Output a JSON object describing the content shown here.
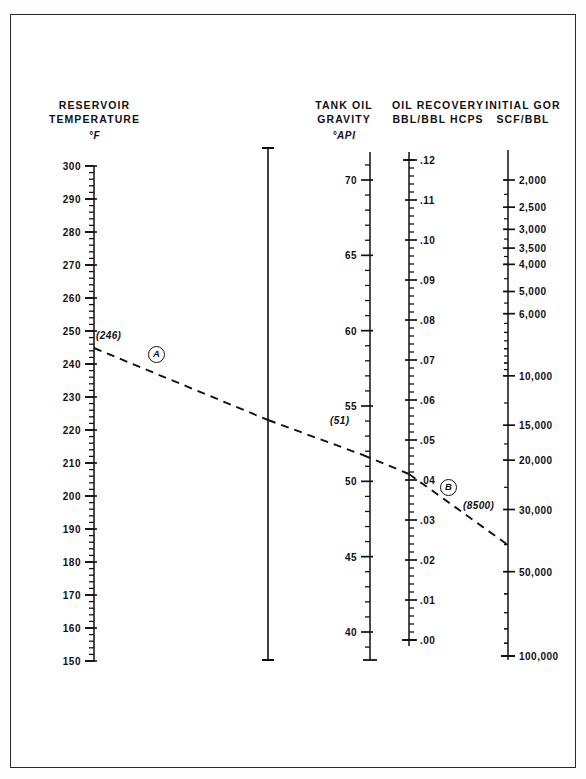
{
  "figure": {
    "kind": "nomograph",
    "background": "#ffffff",
    "border_color": "#2a2a2a",
    "line_color": "#111111"
  },
  "axes": {
    "temperature": {
      "title_line1": "RESERVOIR",
      "title_line2": "TEMPERATURE",
      "unit": "°F",
      "ticks": [
        "300",
        "290",
        "280",
        "270",
        "260",
        "250",
        "240",
        "230",
        "220",
        "210",
        "200",
        "190",
        "180",
        "170",
        "160",
        "150"
      ]
    },
    "gravity": {
      "title_line1": "TANK OIL",
      "title_line2": "GRAVITY",
      "unit": "°API",
      "ticks": [
        "70",
        "65",
        "60",
        "55",
        "50",
        "45",
        "40"
      ]
    },
    "recovery": {
      "title_line1": "OIL RECOVERY",
      "title_line2": "BBL/BBL HCPS",
      "unit": "",
      "ticks": [
        ".12",
        ".11",
        ".10",
        ".09",
        ".08",
        ".07",
        ".06",
        ".05",
        ".04",
        ".03",
        ".02",
        ".01",
        ".00"
      ]
    },
    "gor": {
      "title_line1": "INITIAL GOR",
      "title_line2": "SCF/BBL",
      "unit": "",
      "ticks": [
        "2,000",
        "2,500",
        "3,000",
        "3,500",
        "4,000",
        "5,000",
        "6,000",
        "10,000",
        "15,000",
        "20,000",
        "30,000",
        "50,000",
        "100,000"
      ]
    }
  },
  "annotations": {
    "temp_value": "(246)",
    "gravity_value": "(51)",
    "gor_value": "(8500)",
    "key_a": "A",
    "key_b": "B"
  },
  "chart_data": {
    "type": "line",
    "subtitle": "",
    "xlabel": "",
    "ylabel": "",
    "grid": false,
    "legend": "none",
    "scales": [
      {
        "name": "Reservoir Temperature",
        "units": "°F",
        "orientation": "vertical",
        "direction": "descending",
        "range": [
          150,
          300
        ],
        "major_step": 10,
        "minor_per_major": 5,
        "tick_labels": [
          "300",
          "290",
          "280",
          "270",
          "260",
          "250",
          "240",
          "230",
          "220",
          "210",
          "200",
          "190",
          "180",
          "170",
          "160",
          "150"
        ],
        "tick_values": [
          300,
          290,
          280,
          270,
          260,
          250,
          240,
          230,
          220,
          210,
          200,
          190,
          180,
          170,
          160,
          150
        ]
      },
      {
        "name": "Pivot Line",
        "units": "",
        "orientation": "vertical",
        "direction": "none",
        "range": [
          0,
          1
        ],
        "tick_labels": [],
        "tick_values": []
      },
      {
        "name": "Tank Oil Gravity",
        "units": "°API",
        "orientation": "vertical",
        "direction": "descending",
        "range": [
          40,
          70
        ],
        "major_step": 5,
        "minor_per_major": 5,
        "tick_labels": [
          "70",
          "65",
          "60",
          "55",
          "50",
          "45",
          "40"
        ],
        "tick_values": [
          70,
          65,
          60,
          55,
          50,
          45,
          40
        ]
      },
      {
        "name": "Oil Recovery",
        "units": "BBL/BBL HCPS",
        "orientation": "vertical",
        "direction": "descending",
        "range": [
          0.0,
          0.12
        ],
        "major_step": 0.01,
        "minor_per_major": 5,
        "tick_labels": [
          ".12",
          ".11",
          ".10",
          ".09",
          ".08",
          ".07",
          ".06",
          ".05",
          ".04",
          ".03",
          ".02",
          ".01",
          ".00"
        ],
        "tick_values": [
          0.12,
          0.11,
          0.1,
          0.09,
          0.08,
          0.07,
          0.06,
          0.05,
          0.04,
          0.03,
          0.02,
          0.01,
          0.0
        ]
      },
      {
        "name": "Initial GOR",
        "units": "SCF/BBL",
        "orientation": "vertical",
        "direction": "descending",
        "scale_type": "logarithmic",
        "range": [
          2000,
          100000
        ],
        "tick_labels": [
          "2,000",
          "2,500",
          "3,000",
          "3,500",
          "4,000",
          "5,000",
          "6,000",
          "10,000",
          "15,000",
          "20,000",
          "30,000",
          "50,000",
          "100,000"
        ],
        "tick_values": [
          2000,
          2500,
          3000,
          3500,
          4000,
          5000,
          6000,
          10000,
          15000,
          20000,
          30000,
          50000,
          100000
        ]
      }
    ],
    "construction_lines": [
      {
        "id": "A",
        "style": "dashed",
        "label": "A",
        "from_scale": "Reservoir Temperature",
        "from_value": 246,
        "from_label": "(246)",
        "to_scale": "Tank Oil Gravity",
        "to_value": 51,
        "to_label": "(51)"
      },
      {
        "id": "B",
        "style": "dashed",
        "label": "B",
        "from_scale": "Tank Oil Gravity",
        "from_value": 51,
        "from_label": "(51)",
        "through_scale": "Oil Recovery",
        "through_value": 0.035,
        "to_scale": "Initial GOR",
        "to_value": 8500,
        "to_label": "(8500)"
      }
    ]
  }
}
